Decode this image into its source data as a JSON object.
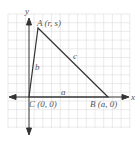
{
  "diagram": {
    "type": "coordinate-triangle",
    "axes": {
      "x_label": "x",
      "y_label": "y"
    },
    "vertices": [
      {
        "name": "A",
        "coords": "(r, s)",
        "label": "A (r, s)"
      },
      {
        "name": "B",
        "coords": "(a, 0)",
        "label": "B (a, 0)"
      },
      {
        "name": "C",
        "coords": "(0, 0)",
        "label": "C (0, 0)"
      }
    ],
    "sides": [
      {
        "name": "a",
        "between": "B-C"
      },
      {
        "name": "b",
        "between": "A-C"
      },
      {
        "name": "c",
        "between": "A-B"
      }
    ],
    "colors": {
      "grid": "#dcdcdc",
      "axis": "#333333",
      "triangle": "#333333",
      "label": "#555555"
    }
  }
}
